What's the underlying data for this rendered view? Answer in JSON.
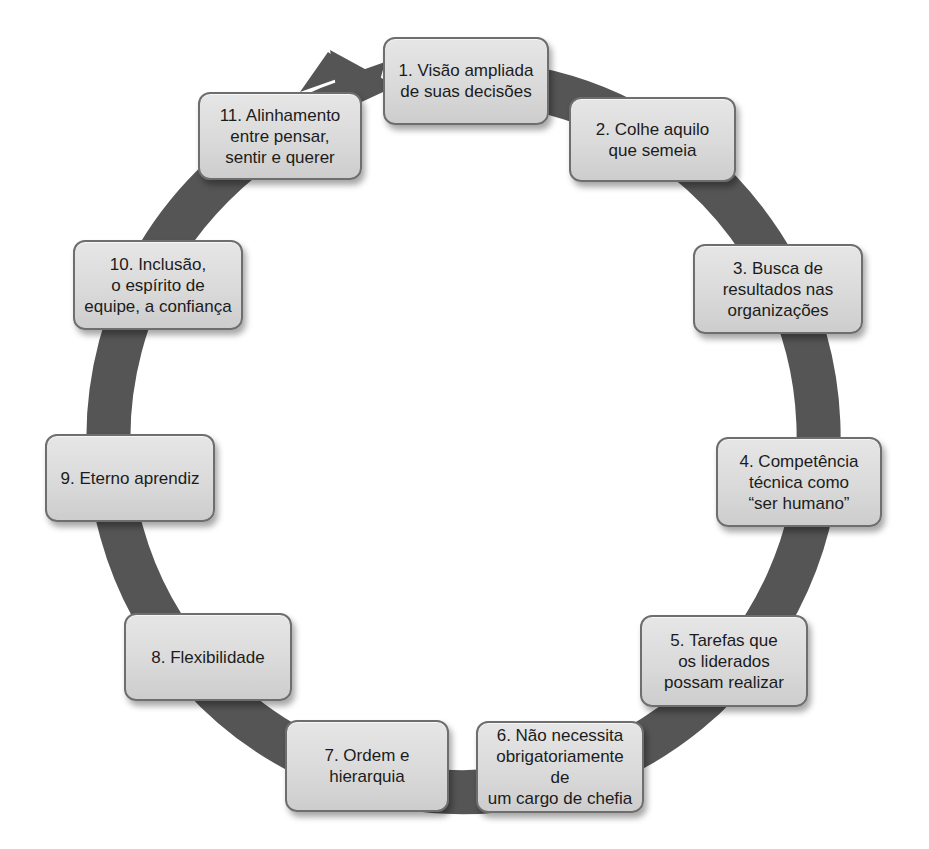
{
  "diagram": {
    "type": "cycle",
    "colors": {
      "ring": "#555555",
      "node_fill": "#d9d9d9",
      "node_border": "#6e6e6e",
      "text": "#1c1c1c"
    },
    "nodes": [
      {
        "label": "1. Visão ampliada\nde suas decisões"
      },
      {
        "label": "2. Colhe aquilo\nque semeia"
      },
      {
        "label": "3. Busca de\nresultados nas\norganizações"
      },
      {
        "label": "4. Competência\ntécnica como\n“ser humano”"
      },
      {
        "label": "5. Tarefas que\nos liderados\npossam realizar"
      },
      {
        "label": "6. Não necessita\nobrigatoriamente de\num cargo de chefia"
      },
      {
        "label": "7. Ordem e\nhierarquia"
      },
      {
        "label": "8. Flexibilidade"
      },
      {
        "label": "9. Eterno aprendiz"
      },
      {
        "label": "10. Inclusão,\no espírito de\nequipe, a confiança"
      },
      {
        "label": "11. Alinhamento\nentre pensar,\nsentir e querer"
      }
    ]
  }
}
